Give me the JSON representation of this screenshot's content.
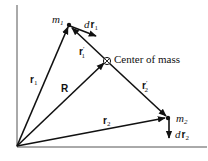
{
  "diagram": {
    "labels": {
      "m1": {
        "main": "m",
        "sub": "1"
      },
      "m2": {
        "main": "m",
        "sub": "2"
      },
      "dr1": {
        "d": "d",
        "main": "r",
        "sub": "1"
      },
      "dr2": {
        "d": "d",
        "main": "r",
        "sub": "2"
      },
      "r1": {
        "main": "r",
        "sub": "1"
      },
      "r2": {
        "main": "r",
        "sub": "2"
      },
      "R": {
        "main": "R"
      },
      "r1_prime": {
        "main": "r",
        "prime": "′",
        "sub": "1"
      },
      "r2_prime": {
        "main": "r",
        "prime": "′",
        "sub": "2"
      },
      "center_of_mass": "Center of mass"
    },
    "vectors": [
      {
        "name": "r1",
        "from": "origin",
        "to": "m1"
      },
      {
        "name": "R",
        "from": "origin",
        "to": "center_of_mass"
      },
      {
        "name": "r2",
        "from": "origin",
        "to": "m2"
      },
      {
        "name": "r1_prime",
        "from": "center_of_mass",
        "to": "m1"
      },
      {
        "name": "r2_prime",
        "from": "center_of_mass",
        "to": "m2"
      },
      {
        "name": "dr1",
        "from": "m1",
        "direction": "down-right"
      },
      {
        "name": "dr2",
        "from": "m2",
        "direction": "down"
      }
    ],
    "colors": {
      "ink": "#111111",
      "axis": "#555555",
      "background": "#ffffff"
    }
  }
}
